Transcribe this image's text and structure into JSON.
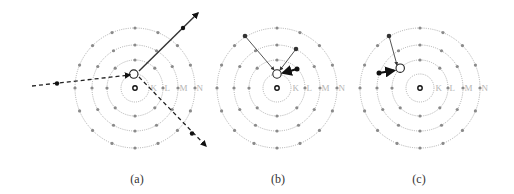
{
  "figure": {
    "panels": [
      {
        "id": "a",
        "caption": "(a)",
        "center": [
          135,
          88
        ],
        "caption_x": 137,
        "shell_labels": [
          "K",
          "L",
          "M",
          "N"
        ],
        "description": "Incident particle ejects K-shell electron"
      },
      {
        "id": "b",
        "caption": "(b)",
        "center": [
          277,
          88
        ],
        "caption_x": 278,
        "shell_labels": [
          "K",
          "L",
          "M",
          "N"
        ],
        "description": "Outer electrons transition to fill K vacancy"
      },
      {
        "id": "c",
        "caption": "(c)",
        "center": [
          420,
          88
        ],
        "caption_x": 419,
        "shell_labels": [
          "K",
          "L",
          "M",
          "N"
        ],
        "description": "Outer electrons transition to fill L vacancy"
      }
    ],
    "shells": [
      {
        "name": "K",
        "radius": 14,
        "electrons": 2
      },
      {
        "name": "L",
        "radius": 28,
        "electrons": 8
      },
      {
        "name": "M",
        "radius": 43,
        "electrons": 12
      },
      {
        "name": "N",
        "radius": 60,
        "electrons": 16
      }
    ],
    "colors": {
      "ring": "#9a9a9a",
      "electron": "#8a8a8a",
      "arrow": "#111111",
      "label": "#b5b5b5"
    }
  }
}
